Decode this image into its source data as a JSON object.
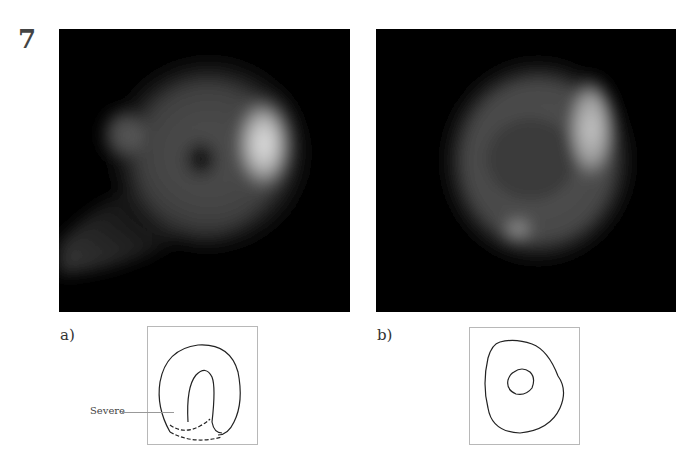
{
  "figure": {
    "number": "7",
    "panels": [
      {
        "id": "a",
        "label": "a)",
        "scan": {
          "description": "perfusion-scan",
          "has_central_defect": true
        },
        "diagram": {
          "annotation": "Severe",
          "shape": "ring-with-inferior-defect"
        }
      },
      {
        "id": "b",
        "label": "b)",
        "scan": {
          "description": "perfusion-scan",
          "has_central_defect": false
        },
        "diagram": {
          "annotation": "",
          "shape": "concentric-rings"
        }
      }
    ]
  },
  "colors": {
    "background": "#ffffff",
    "scan_background": "#000000",
    "diagram_border": "#b8b8b8",
    "diagram_stroke": "#222222"
  }
}
